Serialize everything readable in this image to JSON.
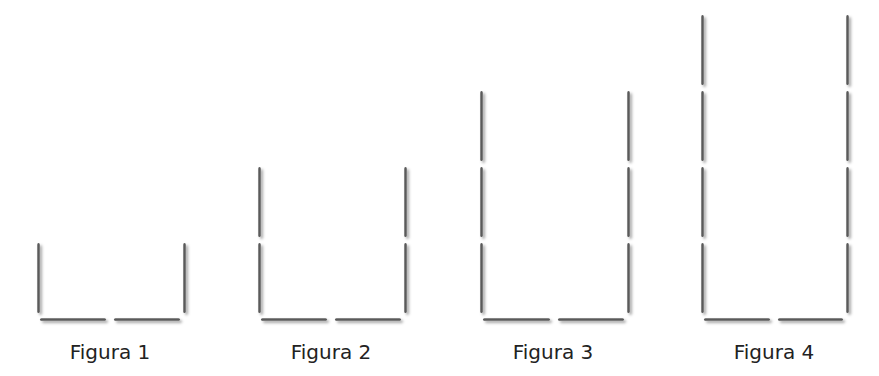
{
  "figures": [
    {
      "label": "Figura 1",
      "levels": 1,
      "left_x": 37,
      "right_x": 183,
      "base_y": 318,
      "label_x": 110,
      "label_y": 340
    },
    {
      "label": "Figura 2",
      "levels": 2,
      "left_x": 258,
      "right_x": 404,
      "base_y": 318,
      "label_x": 331,
      "label_y": 340
    },
    {
      "label": "Figura 3",
      "levels": 3,
      "left_x": 480,
      "right_x": 627,
      "base_y": 318,
      "label_x": 553,
      "label_y": 340
    },
    {
      "label": "Figura 4",
      "levels": 4,
      "left_x": 701,
      "right_x": 846,
      "base_y": 318,
      "label_x": 774,
      "label_y": 340
    }
  ],
  "stick": {
    "length": 70,
    "gap": 6,
    "color": "#5a5a5a"
  },
  "pattern": {
    "bottom_sticks_per_figure": 2,
    "vertical_sticks_per_side_equals_figure_number": true
  }
}
